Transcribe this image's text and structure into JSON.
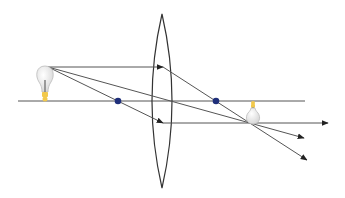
{
  "diagram": {
    "type": "convex-lens-ray-diagram",
    "colors": {
      "background": "#ffffff",
      "line": "#555555",
      "lens": "#333333",
      "focal_point": "#1f2f7a",
      "bulb_glass": "#e8e8e8",
      "bulb_base": "#f2c94c"
    },
    "optical_axis": {
      "x1": 18,
      "y": 101,
      "x2": 305
    },
    "lens": {
      "cx": 162,
      "top": 14,
      "bottom": 188,
      "half_width": 10
    },
    "focal_points": [
      {
        "name": "left-focal-point",
        "x": 118,
        "y": 101
      },
      {
        "name": "right-focal-point",
        "x": 216,
        "y": 101
      }
    ],
    "object": {
      "tip_x": 48,
      "tip_y": 67,
      "base_y": 101,
      "orientation": "upright"
    },
    "image": {
      "x": 252,
      "top_y": 102,
      "tip_y": 124,
      "orientation": "inverted"
    },
    "rays": [
      {
        "name": "parallel-ray",
        "points": [
          [
            48,
            67
          ],
          [
            160,
            67
          ]
        ],
        "refracted": [
          [
            160,
            67
          ],
          [
            305,
            160
          ]
        ]
      },
      {
        "name": "center-ray",
        "points": [
          [
            48,
            67
          ],
          [
            305,
            138
          ]
        ]
      },
      {
        "name": "focal-ray",
        "points": [
          [
            48,
            67
          ],
          [
            160,
            122
          ]
        ],
        "refracted": [
          [
            160,
            122
          ],
          [
            328,
            123
          ]
        ]
      }
    ]
  }
}
